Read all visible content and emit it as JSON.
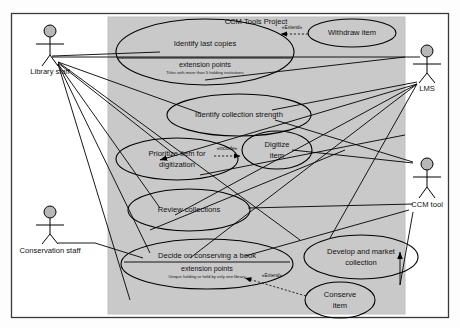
{
  "diagram": {
    "kind": "uml-use-case-diagram",
    "system": {
      "title": "CCM Tools Project",
      "fill_color": "#c9c9c9",
      "border_color": "#bdbdbd"
    },
    "canvas": {
      "background": "#fdfdfd",
      "border_color": "#444444"
    },
    "actors": [
      {
        "id": "library-staff",
        "label": "Library staff"
      },
      {
        "id": "conservation-staff",
        "label": "Conservation staff"
      },
      {
        "id": "lms",
        "label": "LMS"
      },
      {
        "id": "ccm-tool",
        "label": "CCM tool"
      }
    ],
    "use_cases": [
      {
        "id": "identify-last-copies",
        "label": "Identify last copies",
        "compartment_title": "extension points",
        "compartment_detail": "Titles with more than 5 holding institutions"
      },
      {
        "id": "withdraw-item",
        "label": "Withdraw item"
      },
      {
        "id": "identify-collection-strength",
        "label": "Identify collection strength"
      },
      {
        "id": "prioritize-item-for-digitization",
        "label_line1": "Prioritize item for",
        "label_line2": "digitization"
      },
      {
        "id": "digitize-item",
        "label_line1": "Digitize",
        "label_line2": "item"
      },
      {
        "id": "review-collections",
        "label": "Review collections"
      },
      {
        "id": "decide-on-conserving-a-book",
        "label": "Decide on conserving a book",
        "compartment_title": "extension points",
        "compartment_detail": "Unique holding or held by only one library"
      },
      {
        "id": "develop-and-market-collection",
        "label_line1": "Develop and market",
        "label_line2": "collection"
      },
      {
        "id": "conserve-item",
        "label_line1": "Conserve",
        "label_line2": "item"
      }
    ],
    "relationships": [
      {
        "id": "extend-withdraw-item",
        "label": "«Extend»",
        "type": "extend"
      },
      {
        "id": "include-digitize-item",
        "label": "«include»",
        "type": "include"
      },
      {
        "id": "extend-conserve-item",
        "label": "«Extend»",
        "type": "extend"
      }
    ]
  }
}
